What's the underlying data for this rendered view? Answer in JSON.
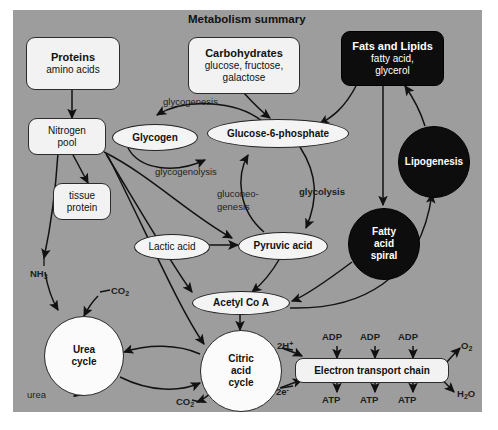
{
  "figure": {
    "title": "Metabolism summary",
    "background_color": "#9d9d9d",
    "page_color": "#ffffff"
  },
  "nodes": {
    "proteins": {
      "title": "Proteins",
      "subtitle": "amino acids",
      "style": "light-box"
    },
    "carbohydrates": {
      "title": "Carbohydrates",
      "line2": "glucose, fructose,",
      "line3": "galactose",
      "style": "light-box"
    },
    "fats": {
      "title": "Fats and Lipids",
      "line2": "fatty acid,",
      "line3": "glycerol",
      "style": "dark-box"
    },
    "nitrogen_pool": {
      "line1": "Nitrogen",
      "line2": "pool",
      "style": "light-box"
    },
    "tissue_protein": {
      "line1": "tissue",
      "line2": "protein",
      "style": "light-box"
    },
    "glycogen": {
      "label": "Glycogen",
      "style": "light-ellipse"
    },
    "glucose6p": {
      "label": "Glucose-6-phosphate",
      "style": "light-ellipse"
    },
    "lactic_acid": {
      "label": "Lactic acid",
      "style": "light-ellipse"
    },
    "pyruvic_acid": {
      "label": "Pyruvic acid",
      "style": "light-ellipse"
    },
    "acetyl_coa": {
      "label": "Acetyl Co A",
      "style": "light-ellipse"
    },
    "lipogenesis": {
      "label": "Lipogenesis",
      "style": "dark-circle"
    },
    "fatty_acid_spiral": {
      "line1": "Fatty",
      "line2": "acid",
      "line3": "spiral",
      "style": "dark-circle"
    },
    "urea_cycle": {
      "line1": "Urea",
      "line2": "cycle",
      "style": "white-circle"
    },
    "citric_acid_cycle": {
      "line1": "Citric",
      "line2": "acid",
      "line3": "cycle",
      "style": "white-circle"
    },
    "electron_transport_chain": {
      "label": "Electron transport chain",
      "style": "light-box"
    }
  },
  "pathway_labels": {
    "glycogenesis": "glycogenesis",
    "glycogenolysis": "glycogenolysis",
    "gluconeogenesis_line1": "gluconeo-",
    "gluconeogenesis_line2": "genesis",
    "glycolysis": "glycolysis"
  },
  "molecule_labels": {
    "ammonia": "NH",
    "ammonia_sub": "3",
    "co2": "CO",
    "co2_sub": "2",
    "co2_lower": "CO",
    "co2_lower_sub": "2",
    "urea": "urea",
    "two_h_plus": "2H",
    "two_h_plus_sup": "+",
    "two_e_minus": "2e",
    "two_e_minus_sup": "-",
    "oxygen": "O",
    "oxygen_sub": "2",
    "water": "H",
    "water_sub": "2",
    "water_tail": "O",
    "adp_1": "ADP",
    "adp_2": "ADP",
    "adp_3": "ADP",
    "atp_1": "ATP",
    "atp_2": "ATP",
    "atp_3": "ATP"
  }
}
